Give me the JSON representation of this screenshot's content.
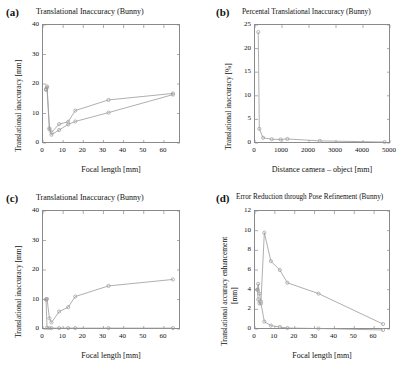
{
  "figure": {
    "panels": [
      {
        "letter": "(a)",
        "title": "Translational Inaccuracy (Bunny)",
        "xlabel": "Focal length [mm]",
        "ylabel": "Translational inaccuracy [mm]"
      },
      {
        "letter": "(b)",
        "title": "Percental Translational Inaccuracy (Bunny)",
        "xlabel": "Distance camera – object [mm]",
        "ylabel": "Translational inaccuracy [%]"
      },
      {
        "letter": "(c)",
        "title": "Translational Inaccuracy (Bunny)",
        "xlabel": "Focal length [mm]",
        "ylabel": "Translational inaccuracy [mm]"
      },
      {
        "letter": "(d)",
        "title": "Error Reduction through Pose Refinement (Bunny)",
        "xlabel": "Focal length [mm]",
        "ylabel_line1": "Translational accuracy enhancement",
        "ylabel_line2": "[mm]"
      }
    ]
  },
  "chart_data": [
    {
      "panel": "a",
      "type": "line",
      "title": "Translational Inaccuracy (Bunny)",
      "xlabel": "Focal length [mm]",
      "ylabel": "Translational inaccuracy [mm]",
      "xlim": [
        0,
        68
      ],
      "ylim": [
        0,
        40
      ],
      "xticks": [
        0,
        10,
        20,
        30,
        40,
        50,
        60
      ],
      "yticks": [
        0,
        10,
        20,
        30,
        40
      ],
      "grid": false,
      "legend": "none",
      "marker": "circle",
      "series": [
        {
          "name": "upper",
          "x": [
            1.5,
            2.0,
            3.2,
            4.2,
            8.0,
            12.5,
            16.0,
            32.5,
            64.5
          ],
          "y": [
            18.3,
            19.2,
            5.0,
            3.6,
            6.4,
            7.2,
            11.0,
            14.6,
            16.8
          ]
        },
        {
          "name": "lower",
          "x": [
            1.5,
            2.0,
            3.2,
            4.2,
            8.0,
            12.5,
            16.0,
            32.5,
            64.5
          ],
          "y": [
            18.0,
            18.8,
            4.6,
            2.8,
            4.4,
            6.3,
            7.3,
            10.3,
            16.4
          ]
        }
      ]
    },
    {
      "panel": "b",
      "type": "line",
      "title": "Percental Translational Inaccuracy (Bunny)",
      "xlabel": "Distance camera – object [mm]",
      "ylabel": "Translational inaccuracy [%]",
      "xlim": [
        0,
        5000
      ],
      "ylim": [
        0,
        25
      ],
      "xticks": [
        0,
        1000,
        2000,
        3000,
        4000,
        5000
      ],
      "yticks": [
        0,
        5,
        10,
        15,
        20,
        25
      ],
      "grid": false,
      "legend": "none",
      "marker": "circle",
      "series": [
        {
          "name": "percental-inaccuracy",
          "x": [
            120,
            160,
            300,
            620,
            950,
            1200,
            2400,
            4800
          ],
          "y": [
            23.5,
            3.0,
            1.1,
            0.8,
            0.75,
            0.85,
            0.45,
            0.2
          ]
        }
      ]
    },
    {
      "panel": "c",
      "type": "line",
      "title": "Translational Inaccuracy (Bunny)",
      "xlabel": "Focal length [mm]",
      "ylabel": "Translational inaccuracy [mm]",
      "xlim": [
        0,
        68
      ],
      "ylim": [
        0,
        40
      ],
      "xticks": [
        0,
        10,
        20,
        30,
        40,
        50,
        60
      ],
      "yticks": [
        0,
        10,
        20,
        30,
        40
      ],
      "grid": false,
      "legend": "none",
      "marker": "circle",
      "series": [
        {
          "name": "before-refinement",
          "x": [
            1.5,
            2.0,
            3.2,
            4.2,
            8.0,
            12.5,
            16.0,
            32.5,
            64.5
          ],
          "y": [
            10.0,
            10.2,
            3.6,
            2.2,
            5.9,
            7.4,
            11.0,
            14.6,
            16.8
          ]
        },
        {
          "name": "after-refinement",
          "x": [
            1.5,
            2.0,
            3.2,
            4.2,
            8.0,
            12.5,
            16.0,
            32.5,
            64.5
          ],
          "y": [
            10.0,
            0.4,
            0.3,
            0.3,
            0.3,
            0.3,
            0.3,
            0.3,
            0.3
          ]
        }
      ]
    },
    {
      "panel": "d",
      "type": "line",
      "title": "Error Reduction through Pose Refinement (Bunny)",
      "xlabel": "Focal length [mm]",
      "ylabel": "Translational accuracy enhancement [mm]",
      "xlim": [
        0,
        68
      ],
      "ylim": [
        0,
        12
      ],
      "xticks": [
        0,
        10,
        20,
        30,
        40,
        50,
        60
      ],
      "yticks": [
        0,
        2,
        4,
        6,
        8,
        10,
        12
      ],
      "grid": false,
      "legend": "none",
      "marker": "circle",
      "series": [
        {
          "name": "upper",
          "x": [
            1.2,
            1.6,
            2.2,
            3.0,
            4.7,
            8.0,
            12.5,
            16.3,
            32.0,
            64.5
          ],
          "y": [
            4.0,
            4.6,
            3.6,
            2.8,
            9.8,
            6.9,
            6.0,
            4.7,
            3.6,
            0.5
          ]
        },
        {
          "name": "lower",
          "x": [
            1.2,
            1.6,
            2.2,
            3.0,
            4.7,
            8.0,
            12.5,
            16.3,
            32.0,
            64.5
          ],
          "y": [
            4.0,
            3.0,
            2.6,
            2.6,
            0.75,
            0.35,
            0.2,
            0.1,
            0.05,
            -0.1
          ]
        }
      ]
    }
  ]
}
